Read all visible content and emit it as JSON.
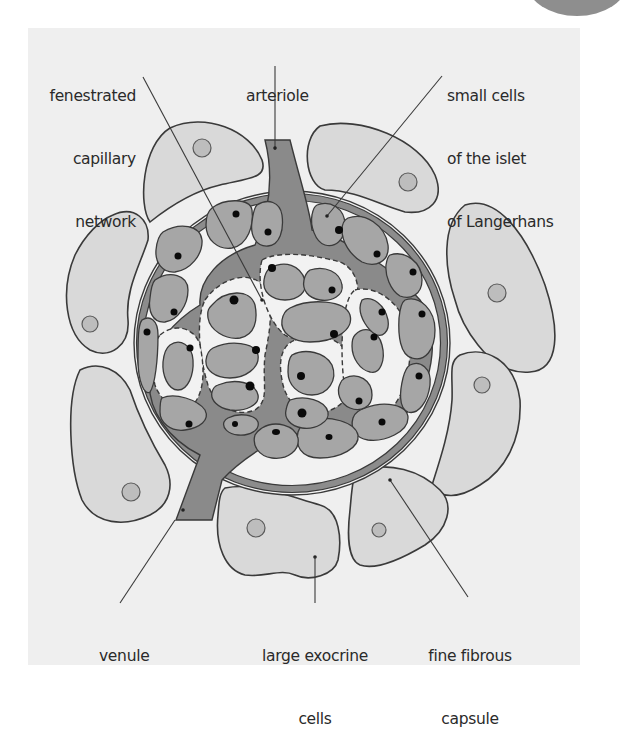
{
  "diagram": {
    "colors": {
      "background": "#efefef",
      "exocrine_cell_fill": "#d9d9d9",
      "exocrine_nucleus_fill": "#bdbdbd",
      "islet_cell_fill": "#a6a6a6",
      "islet_nucleus": "#0a0a0a",
      "capillary_fill": "#8a8a8a",
      "capsule_fill": "#8c8c8c",
      "interstitial_fill": "#f2f2f2",
      "outline": "#3a3a3a"
    },
    "labels": {
      "fenestrated": {
        "lines": [
          "fenestrated",
          "capillary",
          "network"
        ]
      },
      "arteriole": {
        "lines": [
          "arteriole"
        ]
      },
      "small_cells": {
        "lines": [
          "small cells",
          "of the islet",
          "of Langerhans"
        ]
      },
      "venule": {
        "lines": [
          "venule"
        ]
      },
      "exocrine": {
        "lines": [
          "large exocrine",
          "cells"
        ]
      },
      "capsule": {
        "lines": [
          "fine fibrous",
          "capsule"
        ]
      }
    }
  }
}
